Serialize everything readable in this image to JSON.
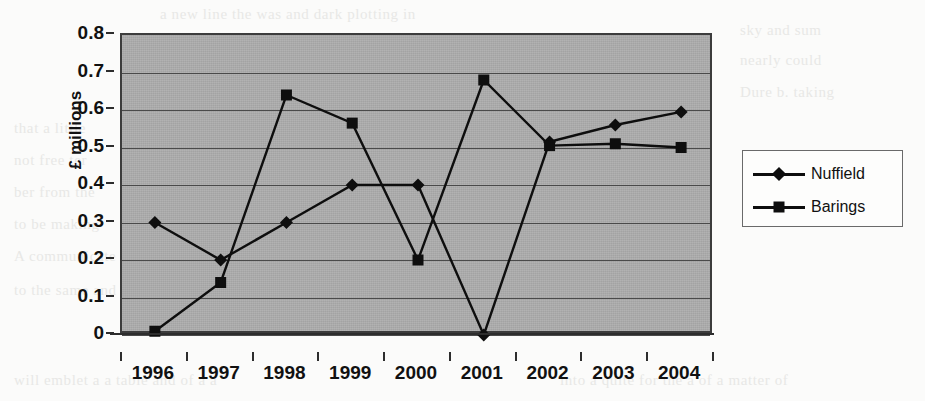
{
  "chart_data": {
    "type": "line",
    "title": "",
    "xlabel": "",
    "ylabel": "£ millions",
    "categories": [
      "1996",
      "1997",
      "1998",
      "1999",
      "2000",
      "2001",
      "2002",
      "2003",
      "2004"
    ],
    "series": [
      {
        "name": "Nuffield",
        "marker": "diamond",
        "color": "#0e0e0e",
        "values": [
          0.3,
          0.2,
          0.3,
          0.4,
          0.4,
          0.0,
          0.515,
          0.56,
          0.595
        ]
      },
      {
        "name": "Barings",
        "marker": "square",
        "color": "#0e0e0e",
        "values": [
          0.01,
          0.14,
          0.64,
          0.565,
          0.2,
          0.68,
          0.505,
          0.51,
          0.5
        ]
      }
    ],
    "ylim": [
      0,
      0.8
    ],
    "ytick_labels": [
      "0.8",
      "0.7",
      "0.6",
      "0.5",
      "0.4",
      "0.3",
      "0.2",
      "0.1",
      "0"
    ],
    "ytick_values": [
      0.8,
      0.7,
      0.6,
      0.5,
      0.4,
      0.3,
      0.2,
      0.1,
      0
    ],
    "grid": true,
    "legend_position": "right",
    "plot_background": "#a3a3a3"
  },
  "legend": {
    "entries": [
      {
        "label": "Nuffield",
        "marker": "diamond"
      },
      {
        "label": "Barings",
        "marker": "square"
      }
    ]
  },
  "bleed_text": {
    "lines": [
      "a new line the was and dark plotting in",
      "sky and sum",
      "nearly could",
      "Dure b. taking",
      "that a little",
      "not free ter",
      "ber from the",
      "to be making",
      "A communicate",
      "to the same and the time",
      "will emblet a a table and  of  a  a",
      "into a quite for the a of a matter of"
    ]
  }
}
